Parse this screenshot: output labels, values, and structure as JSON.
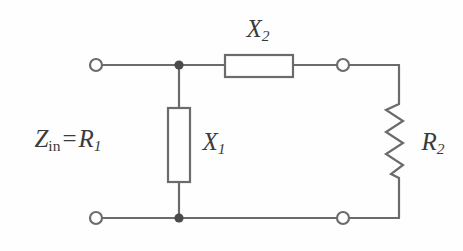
{
  "figure": {
    "type": "circuit-schematic",
    "background_color": "#fefefe",
    "line_color": "#6b6b6b",
    "text_color": "#3b3b3b"
  },
  "labels": {
    "input_impedance": {
      "symbol": "Z",
      "subscript": "in",
      "operator": "=",
      "value_symbol": "R",
      "value_subscript": "1",
      "full_text": "Zin = R1"
    },
    "series_reactance": {
      "symbol": "X",
      "subscript": "2",
      "full_text": "X2"
    },
    "shunt_reactance": {
      "symbol": "X",
      "subscript": "1",
      "full_text": "X1"
    },
    "load_resistance": {
      "symbol": "R",
      "subscript": "2",
      "full_text": "R2"
    }
  },
  "components": [
    {
      "name": "series-reactance-x2",
      "style": "box",
      "orientation": "horizontal",
      "x": 225,
      "y": 55,
      "w": 68,
      "h": 22
    },
    {
      "name": "shunt-reactance-x1",
      "style": "box",
      "orientation": "vertical",
      "x": 168,
      "y": 108,
      "w": 22,
      "h": 74
    },
    {
      "name": "load-resistor-r2",
      "style": "zigzag",
      "orientation": "vertical",
      "x": 399,
      "y_top": 100,
      "y_bottom": 180,
      "amplitude": 9,
      "peaks": 7
    }
  ],
  "terminals": [
    {
      "name": "input-terminal-top",
      "kind": "open",
      "cx": 96,
      "cy": 65,
      "r": 6
    },
    {
      "name": "input-terminal-bottom",
      "kind": "open",
      "cx": 96,
      "cy": 218,
      "r": 6
    },
    {
      "name": "output-terminal-top",
      "kind": "open",
      "cx": 343,
      "cy": 65,
      "r": 6
    },
    {
      "name": "output-terminal-bottom",
      "kind": "open",
      "cx": 343,
      "cy": 218,
      "r": 6
    },
    {
      "name": "junction-node-top",
      "kind": "filled",
      "cx": 179,
      "cy": 65,
      "r": 4.5
    },
    {
      "name": "junction-node-bottom",
      "kind": "filled",
      "cx": 179,
      "cy": 218,
      "r": 4.5
    }
  ],
  "wires": {
    "top_rail_y": 65,
    "bottom_rail_y": 218,
    "right_rail_x": 399,
    "shunt_branch_x": 179
  }
}
